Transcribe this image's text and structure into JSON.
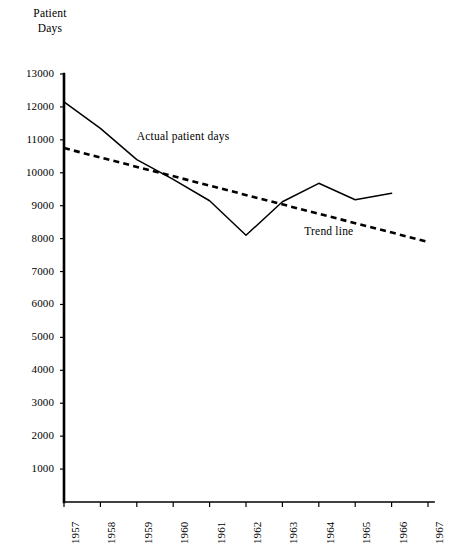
{
  "chart_data": {
    "type": "line",
    "title": "",
    "ylabel": "Patient Days",
    "xlabel": "",
    "grid": false,
    "legend_position": "inline-annotations",
    "x": [
      1957,
      1958,
      1959,
      1960,
      1961,
      1962,
      1963,
      1964,
      1965,
      1966,
      1967
    ],
    "xtick_labels": [
      "1957",
      "1958",
      "1959",
      "1960",
      "1961",
      "1962",
      "1963",
      "1964",
      "1965",
      "1966",
      "1967"
    ],
    "ytick_labels": [
      "13000",
      "12000",
      "11000",
      "10000",
      "9000",
      "8000",
      "7000",
      "6000",
      "5000",
      "4000",
      "3000",
      "2000",
      "1000"
    ],
    "ytick_values": [
      13000,
      12000,
      11000,
      10000,
      9000,
      8000,
      7000,
      6000,
      5000,
      4000,
      3000,
      2000,
      1000
    ],
    "ylim": [
      0,
      13000
    ],
    "xlim": [
      1957,
      1967
    ],
    "series": [
      {
        "name": "Actual patient days",
        "style": "solid",
        "color": "#000000",
        "x": [
          1957,
          1958,
          1959,
          1960,
          1961,
          1962,
          1963,
          1964,
          1965,
          1966
        ],
        "values": [
          12150,
          11350,
          10400,
          9800,
          9150,
          8100,
          9120,
          9680,
          9180,
          9380
        ]
      },
      {
        "name": "Trend line",
        "style": "dashed",
        "color": "#000000",
        "x": [
          1957,
          1967
        ],
        "values": [
          10750,
          7900
        ]
      }
    ],
    "annotations": [
      {
        "text": "Actual patient days",
        "x": 1959.0,
        "y": 11050
      },
      {
        "text": "Trend line",
        "x": 1963.6,
        "y": 8180
      }
    ]
  },
  "axis": {
    "y_title_line1": "Patient",
    "y_title_line2": "Days"
  },
  "colors": {
    "ink": "#000000",
    "background": "#ffffff"
  }
}
